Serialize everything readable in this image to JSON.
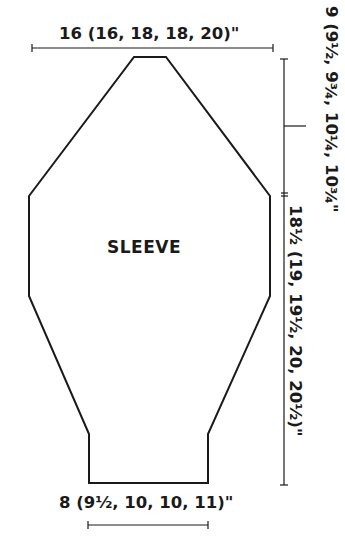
{
  "diagram": {
    "piece_label": "SLEEVE",
    "dimensions": {
      "top_width": "16 (16, 18, 18, 20)\"",
      "cap_height": "9 (9½, 9¾, 10¼, 10¾\"",
      "length_to_underarm": "18½ (19, 19½, 20, 20½)\"",
      "cuff_width": "8 (9½, 10, 10, 11)\""
    },
    "line_color": "#1a1a1a"
  }
}
